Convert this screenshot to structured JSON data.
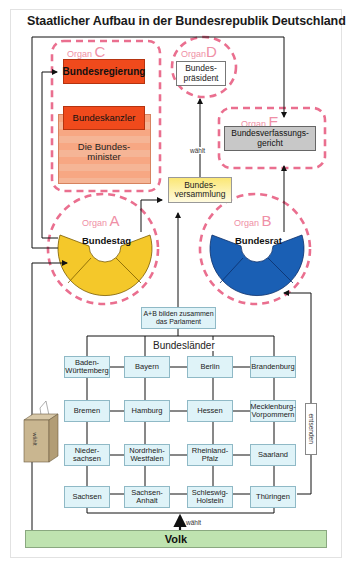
{
  "title": "Staatlicher Aufbau in der Bundesrepublik Deutschland",
  "organs": {
    "A": {
      "label": "Organ",
      "letter": "A",
      "name": "Bundestag",
      "color": "#f4c82a"
    },
    "B": {
      "label": "Organ",
      "letter": "B",
      "name": "Bundesrat",
      "color": "#1a5fb4"
    },
    "C": {
      "label": "Organ",
      "letter": "C",
      "name": "Bundesregierung",
      "kanzler": "Bundeskanzler",
      "minister": "Die Bundes-minister",
      "color": "#f04a1c"
    },
    "D": {
      "label": "Organ",
      "letter": "D",
      "name": "Bundes-präsident"
    },
    "E": {
      "label": "Organ",
      "letter": "E",
      "name": "Bundesverfassungs-gericht",
      "color": "#c8c8c8"
    }
  },
  "bundesversammlung": "Bundes-versammlung",
  "waehlt_label": "wählt",
  "parlament_label": "A+B bilden zusammen das Parlament",
  "bundeslaender": {
    "heading": "Bundesländer",
    "entsenden": "entsenden",
    "rows": [
      [
        "Baden-Württemberg",
        "Bayern",
        "Berlin",
        "Brandenburg"
      ],
      [
        "Bremen",
        "Hamburg",
        "Hessen",
        "Mecklenburg-Vorpommern"
      ],
      [
        "Nieder-sachsen",
        "Nordrhein-Westfalen",
        "Rheinland-Pfalz",
        "Saarland"
      ],
      [
        "Sachsen",
        "Sachsen-Anhalt",
        "Schleswig-Holstein",
        "Thüringen"
      ]
    ]
  },
  "ballot_box_label": "wählt",
  "volk_waehlt": "wählt",
  "volk": "Volk",
  "colors": {
    "dash": "#ea6f8f",
    "land_fill": "#dff3f8",
    "volk_fill": "#bfe3b0"
  }
}
